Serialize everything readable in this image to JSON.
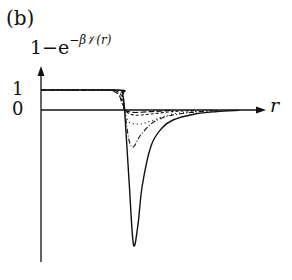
{
  "panel_label": "(b)",
  "chart_data": {
    "type": "line",
    "title": "",
    "xlabel": "r",
    "ylabel_main": "1−e",
    "ylabel_exponent": "−β𝒱(r)",
    "ylabel": "1−e^{−βV(r)}",
    "yticks": [
      "1",
      "0"
    ],
    "ytick_values": [
      1,
      0
    ],
    "grid": false,
    "legend": null,
    "axis_ranges": {
      "x": [
        0,
        10
      ],
      "y": [
        -6.7,
        1.1
      ]
    },
    "series": [
      {
        "name": "solid (deepest well)",
        "style": "solid",
        "x": [
          0,
          3.5,
          3.7,
          3.8,
          4.0,
          4.2,
          4.4,
          4.6,
          5.0,
          5.5,
          6.0,
          7.0,
          8.0,
          9.0
        ],
        "y": [
          1,
          1,
          0.8,
          0.0,
          -3.5,
          -6.7,
          -5.8,
          -3.8,
          -1.8,
          -0.9,
          -0.5,
          -0.2,
          -0.08,
          -0.02
        ]
      },
      {
        "name": "dash-dot",
        "style": "dashdot",
        "x": [
          0,
          3.4,
          3.7,
          3.8,
          4.0,
          4.2,
          4.5,
          5.0,
          5.5,
          6.0,
          7.0,
          8.0
        ],
        "y": [
          1,
          1,
          0.6,
          0.0,
          -1.5,
          -1.85,
          -1.3,
          -0.7,
          -0.4,
          -0.25,
          -0.1,
          -0.03
        ]
      },
      {
        "name": "dotted",
        "style": "dotted",
        "x": [
          0,
          3.3,
          3.7,
          3.8,
          4.0,
          4.5,
          5.0,
          5.5,
          6.0,
          7.0,
          8.0
        ],
        "y": [
          1,
          1,
          0.5,
          0.0,
          -0.6,
          -0.7,
          -0.55,
          -0.35,
          -0.2,
          -0.08,
          -0.02
        ]
      },
      {
        "name": "dashed",
        "style": "dashed",
        "x": [
          0,
          3.2,
          3.7,
          3.8,
          4.2,
          5.0,
          6.0,
          7.0
        ],
        "y": [
          1,
          1,
          0.4,
          0.0,
          -0.25,
          -0.2,
          -0.08,
          -0.02
        ]
      },
      {
        "name": "long-dashed",
        "style": "longdash",
        "x": [
          0,
          3.1,
          3.7,
          3.8,
          4.2,
          5.0,
          6.0
        ],
        "y": [
          1,
          1,
          0.3,
          0.0,
          -0.12,
          -0.08,
          -0.02
        ]
      }
    ]
  }
}
